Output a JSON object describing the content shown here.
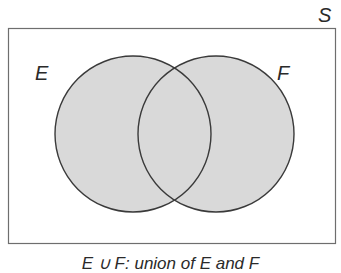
{
  "diagram": {
    "type": "venn",
    "universe_label": "S",
    "sets": [
      {
        "label": "E",
        "cx": 133,
        "cy": 134,
        "r": 78
      },
      {
        "label": "F",
        "cx": 216,
        "cy": 134,
        "r": 78
      }
    ],
    "shaded_region": "E ∪ F",
    "caption": "E ∪ F: union of E and F",
    "colors": {
      "fill": "#d9d9d9",
      "stroke": "#3a3a3a",
      "frame": "#6e6e6e",
      "background": "#ffffff"
    }
  }
}
